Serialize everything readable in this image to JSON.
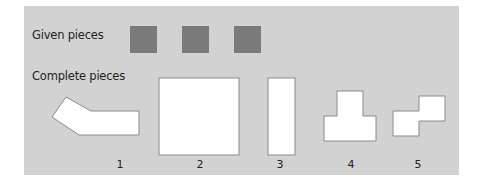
{
  "labels": {
    "given": "Given pieces",
    "complete": "Complete pieces"
  },
  "given_pieces": {
    "count": 3,
    "color": "#7a7a7a"
  },
  "complete_pieces": [
    {
      "number": "1",
      "shape": "bent-arrow-polygon"
    },
    {
      "number": "2",
      "shape": "large-square"
    },
    {
      "number": "3",
      "shape": "tall-rectangle"
    },
    {
      "number": "4",
      "shape": "t-shape"
    },
    {
      "number": "5",
      "shape": "z-shape"
    }
  ],
  "colors": {
    "panel": "#d2d2d2",
    "piece_fill": "#ffffff",
    "piece_stroke": "#8a8a8a"
  }
}
